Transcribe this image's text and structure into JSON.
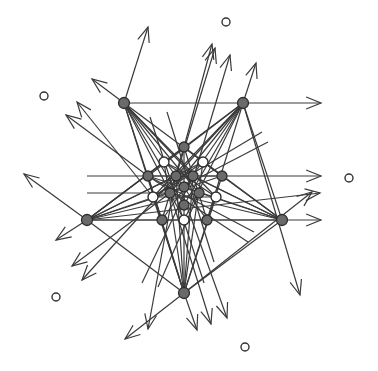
{
  "diagram": {
    "type": "geometric-arrangement",
    "colors": {
      "line": "#3a3a3a",
      "filled_node": "#6a6a6a",
      "node_stroke": "#2e2e2e",
      "background": "#ffffff"
    },
    "nodes": [
      {
        "id": "A",
        "x": 124,
        "y": 103,
        "kind": "filled",
        "r": 5.5
      },
      {
        "id": "B",
        "x": 243,
        "y": 103,
        "kind": "filled",
        "r": 5.5
      },
      {
        "id": "C",
        "x": 87,
        "y": 220,
        "kind": "filled",
        "r": 5.5
      },
      {
        "id": "D",
        "x": 282,
        "y": 220,
        "kind": "filled",
        "r": 5.5
      },
      {
        "id": "E",
        "x": 184,
        "y": 293,
        "kind": "filled",
        "r": 5.5
      },
      {
        "id": "t",
        "x": 184,
        "y": 147,
        "kind": "filled",
        "r": 5
      },
      {
        "id": "h1",
        "x": 164,
        "y": 162,
        "kind": "hollow",
        "r": 5
      },
      {
        "id": "h2",
        "x": 203,
        "y": 162,
        "kind": "hollow",
        "r": 5
      },
      {
        "id": "r1",
        "x": 148,
        "y": 176,
        "kind": "filled",
        "r": 5
      },
      {
        "id": "r2",
        "x": 176,
        "y": 176,
        "kind": "filled",
        "r": 5
      },
      {
        "id": "r3",
        "x": 193,
        "y": 176,
        "kind": "filled",
        "r": 5
      },
      {
        "id": "r4",
        "x": 222,
        "y": 176,
        "kind": "filled",
        "r": 5
      },
      {
        "id": "m",
        "x": 184,
        "y": 187,
        "kind": "filled",
        "r": 5
      },
      {
        "id": "m1",
        "x": 170,
        "y": 193,
        "kind": "filled",
        "r": 5
      },
      {
        "id": "m2",
        "x": 199,
        "y": 193,
        "kind": "filled",
        "r": 5
      },
      {
        "id": "h3",
        "x": 153,
        "y": 197,
        "kind": "hollow",
        "r": 5
      },
      {
        "id": "h4",
        "x": 216,
        "y": 197,
        "kind": "hollow",
        "r": 5
      },
      {
        "id": "b",
        "x": 184,
        "y": 205,
        "kind": "filled",
        "r": 5
      },
      {
        "id": "b1",
        "x": 162,
        "y": 220,
        "kind": "filled",
        "r": 5
      },
      {
        "id": "b2",
        "x": 207,
        "y": 220,
        "kind": "filled",
        "r": 5
      },
      {
        "id": "h5",
        "x": 184,
        "y": 220,
        "kind": "hollow",
        "r": 5
      }
    ],
    "isolated_points": [
      {
        "x": 226,
        "y": 22
      },
      {
        "x": 44,
        "y": 96
      },
      {
        "x": 349,
        "y": 178
      },
      {
        "x": 56,
        "y": 297
      },
      {
        "x": 245,
        "y": 347
      }
    ],
    "arrows": [
      {
        "x1": 124,
        "y1": 103,
        "x2": 148,
        "y2": 27
      },
      {
        "x1": 124,
        "y1": 103,
        "x2": 92,
        "y2": 79
      },
      {
        "x1": 153,
        "y1": 197,
        "x2": 77,
        "y2": 102
      },
      {
        "x1": 148,
        "y1": 176,
        "x2": 66,
        "y2": 115
      },
      {
        "x1": 87,
        "y1": 220,
        "x2": 24,
        "y2": 174
      },
      {
        "x1": 87,
        "y1": 220,
        "x2": 56,
        "y2": 240
      },
      {
        "x1": 170,
        "y1": 193,
        "x2": 72,
        "y2": 266
      },
      {
        "x1": 176,
        "y1": 176,
        "x2": 82,
        "y2": 280
      },
      {
        "x1": 184,
        "y1": 293,
        "x2": 125,
        "y2": 339
      },
      {
        "x1": 184,
        "y1": 293,
        "x2": 197,
        "y2": 330
      },
      {
        "x1": 170,
        "y1": 193,
        "x2": 211,
        "y2": 324
      },
      {
        "x1": 176,
        "y1": 176,
        "x2": 227,
        "y2": 318
      },
      {
        "x1": 176,
        "y1": 176,
        "x2": 148,
        "y2": 329
      },
      {
        "x1": 243,
        "y1": 103,
        "x2": 300,
        "y2": 295
      },
      {
        "x1": 243,
        "y1": 103,
        "x2": 321,
        "y2": 103
      },
      {
        "x1": 148,
        "y1": 176,
        "x2": 321,
        "y2": 176
      },
      {
        "x1": 162,
        "y1": 220,
        "x2": 321,
        "y2": 220
      },
      {
        "x1": 87,
        "y1": 220,
        "x2": 320,
        "y2": 193
      },
      {
        "x1": 184,
        "y1": 293,
        "x2": 312,
        "y2": 192
      },
      {
        "x1": 194,
        "y1": 176,
        "x2": 230,
        "y2": 55
      },
      {
        "x1": 176,
        "y1": 176,
        "x2": 215,
        "y2": 48
      },
      {
        "x1": 184,
        "y1": 147,
        "x2": 212,
        "y2": 44
      },
      {
        "x1": 243,
        "y1": 103,
        "x2": 256,
        "y2": 63
      }
    ],
    "lines": [
      {
        "x1": 124,
        "y1": 103,
        "x2": 243,
        "y2": 103
      },
      {
        "x1": 87,
        "y1": 176,
        "x2": 148,
        "y2": 176
      },
      {
        "x1": 87,
        "y1": 193,
        "x2": 170,
        "y2": 193
      },
      {
        "x1": 87,
        "y1": 220,
        "x2": 162,
        "y2": 220
      },
      {
        "x1": 124,
        "y1": 103,
        "x2": 184,
        "y2": 293
      },
      {
        "x1": 124,
        "y1": 103,
        "x2": 222,
        "y2": 176
      },
      {
        "x1": 124,
        "y1": 103,
        "x2": 216,
        "y2": 197
      },
      {
        "x1": 124,
        "y1": 103,
        "x2": 207,
        "y2": 220
      },
      {
        "x1": 124,
        "y1": 103,
        "x2": 184,
        "y2": 205
      },
      {
        "x1": 124,
        "y1": 103,
        "x2": 199,
        "y2": 193
      },
      {
        "x1": 124,
        "y1": 103,
        "x2": 193,
        "y2": 176
      },
      {
        "x1": 124,
        "y1": 103,
        "x2": 162,
        "y2": 220
      },
      {
        "x1": 124,
        "y1": 103,
        "x2": 184,
        "y2": 220
      },
      {
        "x1": 243,
        "y1": 103,
        "x2": 87,
        "y2": 220
      },
      {
        "x1": 243,
        "y1": 103,
        "x2": 148,
        "y2": 176
      },
      {
        "x1": 243,
        "y1": 103,
        "x2": 153,
        "y2": 197
      },
      {
        "x1": 243,
        "y1": 103,
        "x2": 162,
        "y2": 220
      },
      {
        "x1": 243,
        "y1": 103,
        "x2": 184,
        "y2": 205
      },
      {
        "x1": 243,
        "y1": 103,
        "x2": 170,
        "y2": 193
      },
      {
        "x1": 243,
        "y1": 103,
        "x2": 176,
        "y2": 176
      },
      {
        "x1": 243,
        "y1": 103,
        "x2": 207,
        "y2": 220
      },
      {
        "x1": 243,
        "y1": 103,
        "x2": 184,
        "y2": 220
      },
      {
        "x1": 87,
        "y1": 220,
        "x2": 282,
        "y2": 220
      },
      {
        "x1": 87,
        "y1": 220,
        "x2": 184,
        "y2": 293
      },
      {
        "x1": 87,
        "y1": 220,
        "x2": 184,
        "y2": 147
      },
      {
        "x1": 87,
        "y1": 220,
        "x2": 164,
        "y2": 162
      },
      {
        "x1": 87,
        "y1": 220,
        "x2": 176,
        "y2": 176
      },
      {
        "x1": 87,
        "y1": 220,
        "x2": 184,
        "y2": 187
      },
      {
        "x1": 87,
        "y1": 220,
        "x2": 199,
        "y2": 193
      },
      {
        "x1": 87,
        "y1": 220,
        "x2": 222,
        "y2": 176
      },
      {
        "x1": 87,
        "y1": 220,
        "x2": 203,
        "y2": 162
      },
      {
        "x1": 282,
        "y1": 220,
        "x2": 184,
        "y2": 293
      },
      {
        "x1": 282,
        "y1": 220,
        "x2": 184,
        "y2": 147
      },
      {
        "x1": 282,
        "y1": 220,
        "x2": 203,
        "y2": 162
      },
      {
        "x1": 282,
        "y1": 220,
        "x2": 193,
        "y2": 176
      },
      {
        "x1": 282,
        "y1": 220,
        "x2": 184,
        "y2": 187
      },
      {
        "x1": 282,
        "y1": 220,
        "x2": 170,
        "y2": 193
      },
      {
        "x1": 282,
        "y1": 220,
        "x2": 148,
        "y2": 176
      },
      {
        "x1": 282,
        "y1": 220,
        "x2": 164,
        "y2": 162
      },
      {
        "x1": 282,
        "y1": 220,
        "x2": 243,
        "y2": 103
      },
      {
        "x1": 184,
        "y1": 293,
        "x2": 148,
        "y2": 176
      },
      {
        "x1": 184,
        "y1": 293,
        "x2": 164,
        "y2": 162
      },
      {
        "x1": 184,
        "y1": 293,
        "x2": 176,
        "y2": 176
      },
      {
        "x1": 184,
        "y1": 293,
        "x2": 184,
        "y2": 147
      },
      {
        "x1": 184,
        "y1": 293,
        "x2": 193,
        "y2": 176
      },
      {
        "x1": 184,
        "y1": 293,
        "x2": 203,
        "y2": 162
      },
      {
        "x1": 184,
        "y1": 293,
        "x2": 222,
        "y2": 176
      },
      {
        "x1": 184,
        "y1": 293,
        "x2": 153,
        "y2": 197
      },
      {
        "x1": 184,
        "y1": 293,
        "x2": 216,
        "y2": 197
      },
      {
        "x1": 150,
        "y1": 117,
        "x2": 204,
        "y2": 283
      },
      {
        "x1": 167,
        "y1": 112,
        "x2": 214,
        "y2": 262
      },
      {
        "x1": 148,
        "y1": 176,
        "x2": 222,
        "y2": 176
      },
      {
        "x1": 153,
        "y1": 197,
        "x2": 216,
        "y2": 197
      },
      {
        "x1": 164,
        "y1": 162,
        "x2": 216,
        "y2": 197
      },
      {
        "x1": 203,
        "y1": 162,
        "x2": 153,
        "y2": 197
      },
      {
        "x1": 184,
        "y1": 147,
        "x2": 162,
        "y2": 220
      },
      {
        "x1": 184,
        "y1": 147,
        "x2": 207,
        "y2": 220
      },
      {
        "x1": 142,
        "y1": 283,
        "x2": 193,
        "y2": 176
      },
      {
        "x1": 158,
        "y1": 287,
        "x2": 199,
        "y2": 193
      },
      {
        "x1": 262,
        "y1": 132,
        "x2": 153,
        "y2": 197
      },
      {
        "x1": 268,
        "y1": 142,
        "x2": 170,
        "y2": 193
      },
      {
        "x1": 148,
        "y1": 176,
        "x2": 254,
        "y2": 232
      },
      {
        "x1": 148,
        "y1": 176,
        "x2": 248,
        "y2": 242
      }
    ]
  }
}
